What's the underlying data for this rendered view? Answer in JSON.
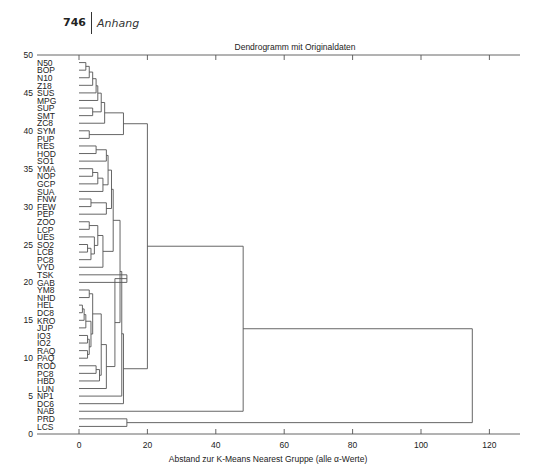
{
  "page_header": {
    "page_number": "746",
    "section": "Anhang"
  },
  "chart_data": {
    "type": "dendrogram",
    "title": "Dendrogramm mit Originaldaten",
    "xlabel": "Abstand zur K-Means Nearest Gruppe (alle α-Werte)",
    "ylabel": "",
    "xlim": [
      -13,
      128
    ],
    "ylim": [
      0,
      50
    ],
    "x_ticks": [
      0,
      20,
      40,
      60,
      80,
      100,
      120
    ],
    "y_ticks": [
      0,
      5,
      10,
      15,
      20,
      25,
      30,
      35,
      40,
      45,
      50
    ],
    "orientation": "horizontal",
    "leaves_top_to_bottom": [
      "N50",
      "BOP",
      "N10",
      "Z18",
      "SUS",
      "MPG",
      "SUP",
      "SMT",
      "ZC8",
      "SYM",
      "PUP",
      "RES",
      "HOD",
      "SO1",
      "YMA",
      "NOP",
      "GCP",
      "SUA",
      "FNW",
      "FEW",
      "PEP",
      "ZOO",
      "LCP",
      "UES",
      "SO2",
      "LCB",
      "PC8",
      "VYD",
      "TSK",
      "GAB",
      "YM8",
      "NHD",
      "HEL",
      "DC8",
      "KRO",
      "JUP",
      "IO3",
      "IO2",
      "RAQ",
      "PAQ",
      "ROD",
      "PC8",
      "HBD",
      "LUN",
      "NP1",
      "DC6",
      "NAB",
      "PRD",
      "LCS"
    ],
    "merges": [
      {
        "id": "m1",
        "children": [
          "N50",
          "BOP"
        ],
        "height": 2
      },
      {
        "id": "m2",
        "children": [
          "m1",
          "N10"
        ],
        "height": 3
      },
      {
        "id": "m3",
        "children": [
          "m2",
          "Z18"
        ],
        "height": 4
      },
      {
        "id": "m4",
        "children": [
          "m3",
          "SUS"
        ],
        "height": 5
      },
      {
        "id": "m5",
        "children": [
          "m4",
          "MPG"
        ],
        "height": 5.5
      },
      {
        "id": "m6",
        "children": [
          "SUP",
          "SMT"
        ],
        "height": 4
      },
      {
        "id": "m7",
        "children": [
          "m5",
          "m6"
        ],
        "height": 6.5
      },
      {
        "id": "m8",
        "children": [
          "m7",
          "ZC8"
        ],
        "height": 7.5
      },
      {
        "id": "m9",
        "children": [
          "SYM",
          "PUP"
        ],
        "height": 3
      },
      {
        "id": "m10",
        "children": [
          "m8",
          "m9"
        ],
        "height": 13
      },
      {
        "id": "m11",
        "children": [
          "RES",
          "HOD"
        ],
        "height": 5
      },
      {
        "id": "m12",
        "children": [
          "m11",
          "SO1"
        ],
        "height": 8
      },
      {
        "id": "m13",
        "children": [
          "YMA",
          "NOP"
        ],
        "height": 4
      },
      {
        "id": "m14",
        "children": [
          "m13",
          "GCP"
        ],
        "height": 5.5
      },
      {
        "id": "m15",
        "children": [
          "m14",
          "SUA"
        ],
        "height": 7
      },
      {
        "id": "m16",
        "children": [
          "m12",
          "m15"
        ],
        "height": 8.5
      },
      {
        "id": "m17",
        "children": [
          "FNW",
          "FEW"
        ],
        "height": 3.5
      },
      {
        "id": "m18",
        "children": [
          "m17",
          "PEP"
        ],
        "height": 8
      },
      {
        "id": "m19",
        "children": [
          "m16",
          "m18"
        ],
        "height": 9.5
      },
      {
        "id": "m20",
        "children": [
          "ZOO",
          "LCP"
        ],
        "height": 3
      },
      {
        "id": "m21",
        "children": [
          "SO2",
          "LCB"
        ],
        "height": 2.5
      },
      {
        "id": "m22",
        "children": [
          "m21",
          "PC8"
        ],
        "height": 3.5
      },
      {
        "id": "m23",
        "children": [
          "UES",
          "m22"
        ],
        "height": 4.5
      },
      {
        "id": "m24",
        "children": [
          "m20",
          "m23"
        ],
        "height": 5.5
      },
      {
        "id": "m25",
        "children": [
          "m24",
          "VYD"
        ],
        "height": 7
      },
      {
        "id": "m26",
        "children": [
          "m19",
          "m25"
        ],
        "height": 10
      },
      {
        "id": "m27",
        "children": [
          "TSK",
          "GAB"
        ],
        "height": 14
      },
      {
        "id": "m28",
        "children": [
          "YM8",
          "NHD"
        ],
        "height": 3
      },
      {
        "id": "m29",
        "children": [
          "HEL",
          "DC8"
        ],
        "height": 1
      },
      {
        "id": "m30",
        "children": [
          "m29",
          "KRO"
        ],
        "height": 1.5
      },
      {
        "id": "m31",
        "children": [
          "m30",
          "JUP"
        ],
        "height": 2
      },
      {
        "id": "m32",
        "children": [
          "IO3",
          "IO2"
        ],
        "height": 2.5
      },
      {
        "id": "m33",
        "children": [
          "RAQ",
          "PAQ"
        ],
        "height": 2.5
      },
      {
        "id": "m34",
        "children": [
          "m32",
          "m33"
        ],
        "height": 3
      },
      {
        "id": "m35",
        "children": [
          "m31",
          "m34"
        ],
        "height": 3.5
      },
      {
        "id": "m36",
        "children": [
          "m28",
          "m35"
        ],
        "height": 4
      },
      {
        "id": "m37",
        "children": [
          "ROD",
          "PC8"
        ],
        "height": 5
      },
      {
        "id": "m38",
        "children": [
          "m37",
          "HBD"
        ],
        "height": 6
      },
      {
        "id": "m39",
        "children": [
          "m36",
          "m38"
        ],
        "height": 6.5
      },
      {
        "id": "m40",
        "children": [
          "m39",
          "LUN"
        ],
        "height": 8
      },
      {
        "id": "m41",
        "children": [
          "m27",
          "m40"
        ],
        "height": 10.5
      },
      {
        "id": "m42",
        "children": [
          "m26",
          "m41"
        ],
        "height": 12
      },
      {
        "id": "m43",
        "children": [
          "m42",
          "NP1"
        ],
        "height": 12.5
      },
      {
        "id": "m44",
        "children": [
          "m43",
          "DC6"
        ],
        "height": 13
      },
      {
        "id": "m45",
        "children": [
          "m10",
          "m44"
        ],
        "height": 20
      },
      {
        "id": "m46",
        "children": [
          "m45",
          "NAB"
        ],
        "height": 48
      },
      {
        "id": "m47",
        "children": [
          "PRD",
          "LCS"
        ],
        "height": 14
      },
      {
        "id": "m48",
        "children": [
          "m46",
          "m47"
        ],
        "height": 115
      }
    ]
  }
}
